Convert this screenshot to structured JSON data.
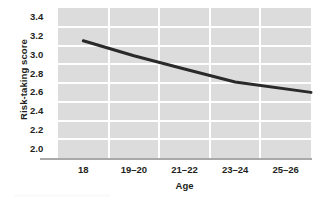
{
  "chart_data": {
    "type": "line",
    "title": "",
    "xlabel": "Age",
    "ylabel": "Risk-taking score",
    "categories": [
      "18",
      "19–20",
      "21–22",
      "23–24",
      "25–26"
    ],
    "series": [
      {
        "name": "Risk-taking score",
        "values": [
          3.15,
          2.99,
          2.85,
          2.71,
          2.6
        ],
        "color": "#2a2a2a"
      }
    ],
    "ylim": [
      1.9,
      3.5
    ],
    "yticks": [
      "3.4",
      "3.2",
      "3.0",
      "2.8",
      "2.6",
      "2.4",
      "2.2",
      "2.0"
    ],
    "ytick_values": [
      3.4,
      3.2,
      3.0,
      2.8,
      2.6,
      2.4,
      2.2,
      2.0
    ],
    "grid": "horizontal and vertical white gridlines on gray panel",
    "legend": "none",
    "panel_color": "#dcdcdc",
    "gridline_color": "#ffffff",
    "axis_color": "#a9a9a9"
  },
  "axes": {
    "y_title": "Risk-taking score",
    "x_title": "Age"
  }
}
